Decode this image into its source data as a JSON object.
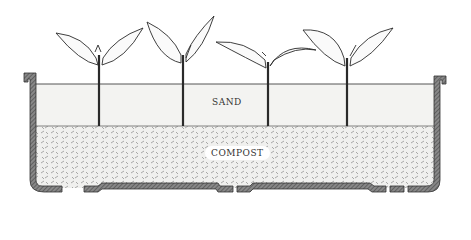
{
  "diagram": {
    "title": "",
    "labels": {
      "sand": "SAND",
      "compost": "COMPOST"
    },
    "layers": [
      {
        "name": "sand",
        "position": "top",
        "fill": "#f4f4f2"
      },
      {
        "name": "compost",
        "position": "bottom",
        "fill": "#e6e6e2"
      }
    ],
    "plants": [
      {
        "id": 1,
        "stem_x": 100
      },
      {
        "id": 2,
        "stem_x": 183
      },
      {
        "id": 3,
        "stem_x": 267
      },
      {
        "id": 4,
        "stem_x": 347
      }
    ],
    "colors": {
      "tray": "#6a6a6a",
      "ink": "#2a2a2a",
      "background": "#ffffff"
    }
  }
}
